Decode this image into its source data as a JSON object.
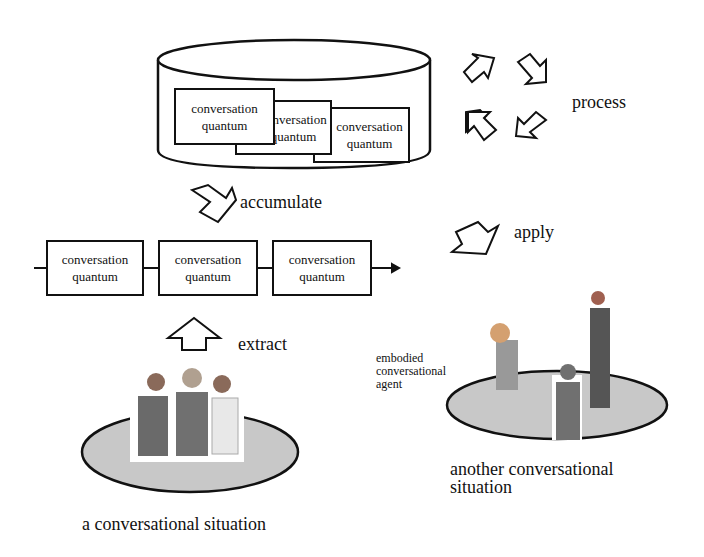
{
  "database": {
    "label": "conversation quantum database",
    "quanta": [
      {
        "line1": "conversation",
        "line2": "quantum"
      },
      {
        "line1": "conversation",
        "line2": "quantum"
      },
      {
        "line1": "conversation",
        "line2": "quantum"
      }
    ]
  },
  "process": {
    "label": "process"
  },
  "accumulate": {
    "label": "accumulate"
  },
  "apply": {
    "label": "apply"
  },
  "extract": {
    "label": "extract"
  },
  "sequence": {
    "quanta": [
      {
        "line1": "conversation",
        "line2": "quantum"
      },
      {
        "line1": "conversation",
        "line2": "quantum"
      },
      {
        "line1": "conversation",
        "line2": "quantum"
      }
    ]
  },
  "situation_left": {
    "caption": "a conversational situation"
  },
  "situation_right": {
    "agent_label_1": "embodied",
    "agent_label_2": "conversational",
    "agent_label_3": "agent",
    "caption_1": "another conversational",
    "caption_2": "situation"
  },
  "colors": {
    "stroke": "#111111",
    "platform": "#c8c8c8",
    "suit": "#6a6a6a"
  }
}
